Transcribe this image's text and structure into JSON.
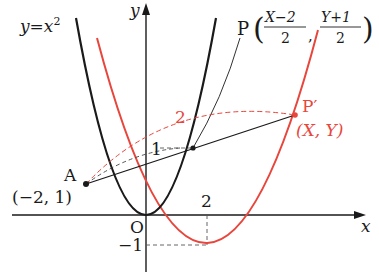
{
  "figure": {
    "curve_label": "y=x²",
    "curve_label_base": "y",
    "curve_label_eq": "=",
    "curve_label_var": "x",
    "curve_label_exp": "2",
    "axis_x_label": "x",
    "axis_y_label": "y",
    "origin_label": "O",
    "tick_x_2": "2",
    "tick_y_neg1": "−1",
    "point_A": {
      "name": "A",
      "coords": "(−2, 1)"
    },
    "point_P": {
      "name": "P",
      "x_num": "X−2",
      "x_den": "2",
      "y_num": "Y+1",
      "y_den": "2",
      "comma": ","
    },
    "point_P_prime": {
      "name": "P′",
      "coords": "(X, Y)"
    },
    "ratio_small": "1",
    "ratio_large": "2",
    "colors": {
      "black": "#1a1a1a",
      "red": "#e8463c",
      "dashed_gray": "#555555"
    }
  }
}
